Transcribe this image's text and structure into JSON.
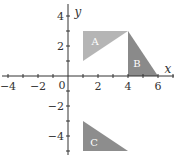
{
  "diagram": {
    "type": "coordinate-plane",
    "axes": {
      "x_label": "x",
      "y_label": "y",
      "origin_label": "0",
      "x_ticks": [
        {
          "value": -4,
          "label": "−4"
        },
        {
          "value": -2,
          "label": "−2"
        },
        {
          "value": 2,
          "label": "2"
        },
        {
          "value": 4,
          "label": "4"
        },
        {
          "value": 6,
          "label": "6"
        }
      ],
      "y_ticks": [
        {
          "value": 4,
          "label": "4"
        },
        {
          "value": 2,
          "label": "2"
        },
        {
          "value": -2,
          "label": "−2"
        },
        {
          "value": -4,
          "label": "−4"
        }
      ]
    },
    "shapes": [
      {
        "label": "A",
        "vertices": [
          [
            1,
            1
          ],
          [
            1,
            3
          ],
          [
            4,
            3
          ]
        ],
        "color": "#b5b5b5"
      },
      {
        "label": "B",
        "vertices": [
          [
            4,
            3
          ],
          [
            4,
            0
          ],
          [
            6,
            0
          ]
        ],
        "color": "#8a8a8a"
      },
      {
        "label": "C",
        "vertices": [
          [
            1,
            -3
          ],
          [
            1,
            -5
          ],
          [
            4,
            -5
          ]
        ],
        "color": "#8d8d8d"
      }
    ]
  }
}
